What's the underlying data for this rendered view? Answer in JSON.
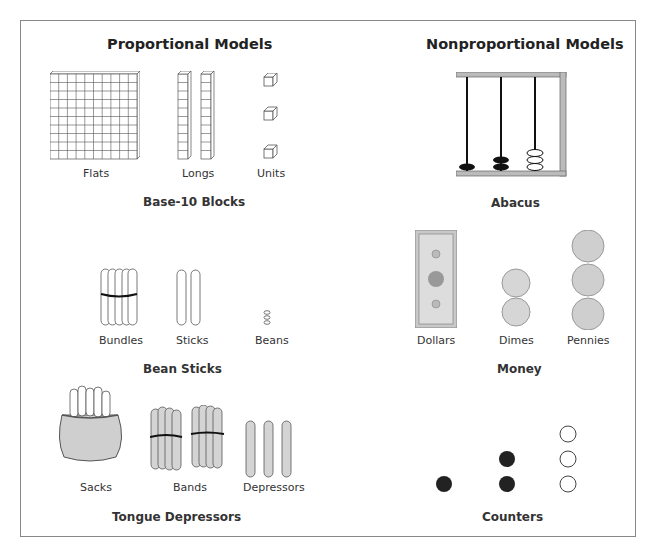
{
  "figure": {
    "columns": [
      {
        "title": "Proportional Models",
        "groups": [
          {
            "name": "Base-10 Blocks",
            "items": [
              "Flats",
              "Longs",
              "Units"
            ]
          },
          {
            "name": "Bean Sticks",
            "items": [
              "Bundles",
              "Sticks",
              "Beans"
            ]
          },
          {
            "name": "Tongue Depressors",
            "items": [
              "Sacks",
              "Bands",
              "Depressors"
            ]
          }
        ]
      },
      {
        "title": "Nonproportional Models",
        "groups": [
          {
            "name": "Abacus",
            "items": []
          },
          {
            "name": "Money",
            "items": [
              "Dollars",
              "Dimes",
              "Pennies"
            ]
          },
          {
            "name": "Counters",
            "items": []
          }
        ]
      }
    ],
    "abacus": {
      "rods": [
        {
          "beads": 1,
          "color": "black"
        },
        {
          "beads": 2,
          "color": "black"
        },
        {
          "beads": 3,
          "color": "white"
        }
      ]
    },
    "counters": {
      "columns": [
        {
          "count": 1,
          "color": "black"
        },
        {
          "count": 2,
          "color": "black"
        },
        {
          "count": 3,
          "color": "white"
        }
      ]
    },
    "colors": {
      "border": "#888888",
      "ink": "#222222",
      "fill_gray": "#d0d0d0"
    }
  }
}
